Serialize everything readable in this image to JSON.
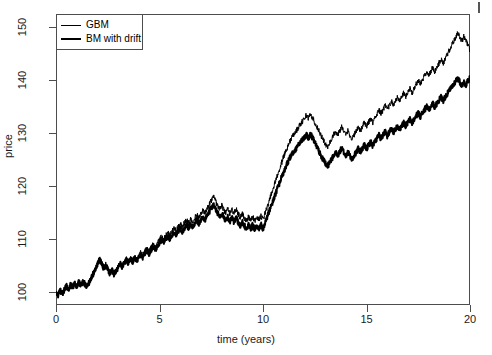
{
  "axes": {
    "x_title": "time (years)",
    "y_title": "price",
    "x_ticks": [
      0,
      5,
      10,
      15,
      20
    ],
    "y_ticks": [
      100,
      110,
      120,
      130,
      140,
      150
    ]
  },
  "legend": {
    "position": "top-left",
    "entries": [
      {
        "label": "GBM",
        "key": "thin-line",
        "color": "#000000",
        "width": 1
      },
      {
        "label": "BM with drift",
        "key": "thick-line",
        "color": "#000000",
        "width": 2
      }
    ]
  },
  "chart_data": {
    "type": "line",
    "title": "",
    "subtitle": "",
    "xlabel": "time (years)",
    "ylabel": "price",
    "xlim": [
      0,
      20
    ],
    "ylim": [
      97.5,
      152.5
    ],
    "xticks": [
      0,
      5,
      10,
      15,
      20
    ],
    "yticks": [
      100,
      110,
      120,
      130,
      140,
      150
    ],
    "grid": false,
    "legend_position": "top-left",
    "x": [
      0,
      0.1,
      0.2,
      0.3,
      0.4,
      0.5,
      0.6,
      0.7,
      0.8,
      0.9,
      1,
      1.1,
      1.2,
      1.3,
      1.4,
      1.5,
      1.6,
      1.7,
      1.8,
      1.9,
      2,
      2.1,
      2.2,
      2.3,
      2.4,
      2.5,
      2.6,
      2.7,
      2.8,
      2.9,
      3,
      3.1,
      3.2,
      3.3,
      3.4,
      3.5,
      3.6,
      3.7,
      3.8,
      3.9,
      4,
      4.1,
      4.2,
      4.3,
      4.4,
      4.5,
      4.6,
      4.7,
      4.8,
      4.9,
      5,
      5.1,
      5.2,
      5.3,
      5.4,
      5.5,
      5.6,
      5.7,
      5.8,
      5.9,
      6,
      6.1,
      6.2,
      6.3,
      6.4,
      6.5,
      6.6,
      6.7,
      6.8,
      6.9,
      7,
      7.1,
      7.2,
      7.3,
      7.4,
      7.5,
      7.6,
      7.7,
      7.8,
      7.9,
      8,
      8.1,
      8.2,
      8.3,
      8.4,
      8.5,
      8.6,
      8.7,
      8.8,
      8.9,
      9,
      9.1,
      9.2,
      9.3,
      9.4,
      9.5,
      9.6,
      9.7,
      9.8,
      9.9,
      10,
      10.1,
      10.2,
      10.3,
      10.4,
      10.5,
      10.6,
      10.7,
      10.8,
      10.9,
      11,
      11.1,
      11.2,
      11.3,
      11.4,
      11.5,
      11.6,
      11.7,
      11.8,
      11.9,
      12,
      12.1,
      12.2,
      12.3,
      12.4,
      12.5,
      12.6,
      12.7,
      12.8,
      12.9,
      13,
      13.1,
      13.2,
      13.3,
      13.4,
      13.5,
      13.6,
      13.7,
      13.8,
      13.9,
      14,
      14.1,
      14.2,
      14.3,
      14.4,
      14.5,
      14.6,
      14.7,
      14.8,
      14.9,
      15,
      15.1,
      15.2,
      15.3,
      15.4,
      15.5,
      15.6,
      15.7,
      15.8,
      15.9,
      16,
      16.1,
      16.2,
      16.3,
      16.4,
      16.5,
      16.6,
      16.7,
      16.8,
      16.9,
      17,
      17.1,
      17.2,
      17.3,
      17.4,
      17.5,
      17.6,
      17.7,
      17.8,
      17.9,
      18,
      18.1,
      18.2,
      18.3,
      18.4,
      18.5,
      18.6,
      18.7,
      18.8,
      18.9,
      19,
      19.1,
      19.2,
      19.3,
      19.4,
      19.5,
      19.6,
      19.7,
      19.8,
      19.9,
      20
    ],
    "series": [
      {
        "name": "GBM",
        "style": "thin",
        "color": "#000000",
        "linewidth": 1,
        "values": [
          100.0,
          99.4,
          100.2,
          99.6,
          100.4,
          101.1,
          100.5,
          101.4,
          100.8,
          101.6,
          100.9,
          101.8,
          101.2,
          102.0,
          101.4,
          101.0,
          101.8,
          102.6,
          103.4,
          104.4,
          105.4,
          106.2,
          105.4,
          104.6,
          105.2,
          104.4,
          103.6,
          104.2,
          103.4,
          104.0,
          104.8,
          105.4,
          104.8,
          105.6,
          106.2,
          105.6,
          106.4,
          105.8,
          106.6,
          106.0,
          106.8,
          107.4,
          106.8,
          107.6,
          108.2,
          107.6,
          108.4,
          109.0,
          108.4,
          109.2,
          109.8,
          110.4,
          109.8,
          110.6,
          111.2,
          110.6,
          111.4,
          112.0,
          111.4,
          112.2,
          112.8,
          112.2,
          113.0,
          113.6,
          113.0,
          113.8,
          113.2,
          114.0,
          114.6,
          114.0,
          114.8,
          115.4,
          114.8,
          115.6,
          116.4,
          117.2,
          118.0,
          117.2,
          116.4,
          115.6,
          116.4,
          115.6,
          114.8,
          115.6,
          114.8,
          115.6,
          114.8,
          115.6,
          114.8,
          114.0,
          114.8,
          114.0,
          113.4,
          114.2,
          113.4,
          114.2,
          113.4,
          114.2,
          113.6,
          114.4,
          113.6,
          114.8,
          116.0,
          117.2,
          118.4,
          119.6,
          120.8,
          122.0,
          123.2,
          124.4,
          125.6,
          126.6,
          127.6,
          128.4,
          129.2,
          129.8,
          130.4,
          131.0,
          131.6,
          132.2,
          132.8,
          133.4,
          132.8,
          133.6,
          132.8,
          132.0,
          131.2,
          130.4,
          129.6,
          128.8,
          128.0,
          127.2,
          128.0,
          128.8,
          129.6,
          130.4,
          129.6,
          130.4,
          131.2,
          130.4,
          129.6,
          130.4,
          129.6,
          128.8,
          129.6,
          130.4,
          131.2,
          130.4,
          131.2,
          132.0,
          131.2,
          132.0,
          132.8,
          132.0,
          132.8,
          133.6,
          134.4,
          133.6,
          134.4,
          135.2,
          134.4,
          135.2,
          136.0,
          135.2,
          136.0,
          136.8,
          136.0,
          136.8,
          137.6,
          136.8,
          137.6,
          138.4,
          137.6,
          138.4,
          139.2,
          140.0,
          139.2,
          140.0,
          140.8,
          141.6,
          140.8,
          141.6,
          142.4,
          141.6,
          142.4,
          143.2,
          144.0,
          143.2,
          144.0,
          144.8,
          145.6,
          146.4,
          147.2,
          148.0,
          149.0,
          148.2,
          147.4,
          148.2,
          147.4,
          146.6,
          145.6
        ]
      },
      {
        "name": "BM with drift",
        "style": "thick",
        "color": "#000000",
        "linewidth": 2,
        "values": [
          100.0,
          99.4,
          100.2,
          99.6,
          100.4,
          101.1,
          100.5,
          101.4,
          100.8,
          101.6,
          100.9,
          101.8,
          101.2,
          102.0,
          101.4,
          101.0,
          101.8,
          102.6,
          103.4,
          104.4,
          105.3,
          106.1,
          105.3,
          104.5,
          105.1,
          104.3,
          103.5,
          104.1,
          103.3,
          103.9,
          104.7,
          105.3,
          104.7,
          105.4,
          106.0,
          105.4,
          106.2,
          105.6,
          106.4,
          105.8,
          106.5,
          107.1,
          106.5,
          107.2,
          107.8,
          107.2,
          108.0,
          108.6,
          108.0,
          108.7,
          109.3,
          109.9,
          109.3,
          110.0,
          110.6,
          110.0,
          110.8,
          111.3,
          110.7,
          111.4,
          112.0,
          111.4,
          112.1,
          112.7,
          112.1,
          112.8,
          112.2,
          113.0,
          113.5,
          112.9,
          113.6,
          114.2,
          113.6,
          114.3,
          115.0,
          115.8,
          116.5,
          115.7,
          114.9,
          114.2,
          114.9,
          114.1,
          113.4,
          114.1,
          113.3,
          114.0,
          113.2,
          114.0,
          113.2,
          112.5,
          113.2,
          112.5,
          111.9,
          112.6,
          111.8,
          112.6,
          111.8,
          112.5,
          111.9,
          112.7,
          111.9,
          113.0,
          114.1,
          115.2,
          116.3,
          117.4,
          118.5,
          119.5,
          120.6,
          121.7,
          122.7,
          123.6,
          124.5,
          125.3,
          126.0,
          126.6,
          127.1,
          127.7,
          128.2,
          128.7,
          129.2,
          129.7,
          129.1,
          129.8,
          129.0,
          128.2,
          127.4,
          126.6,
          125.8,
          125.0,
          124.3,
          123.6,
          124.3,
          125.0,
          125.7,
          126.4,
          125.7,
          126.4,
          127.1,
          126.4,
          125.7,
          126.4,
          125.7,
          125.0,
          125.7,
          126.4,
          127.1,
          126.4,
          127.0,
          127.7,
          127.0,
          127.7,
          128.3,
          127.6,
          128.3,
          129.0,
          129.6,
          128.9,
          129.6,
          130.2,
          129.5,
          130.2,
          130.8,
          130.1,
          130.8,
          131.4,
          130.7,
          131.4,
          132.0,
          131.3,
          132.0,
          132.6,
          131.9,
          132.6,
          133.2,
          133.8,
          133.1,
          133.8,
          134.4,
          135.0,
          134.3,
          135.0,
          135.6,
          134.9,
          135.6,
          136.2,
          136.8,
          136.1,
          136.8,
          137.4,
          138.0,
          138.6,
          139.2,
          139.8,
          140.4,
          139.7,
          139.0,
          139.7,
          139.0,
          140.0,
          140.3
        ]
      }
    ]
  }
}
